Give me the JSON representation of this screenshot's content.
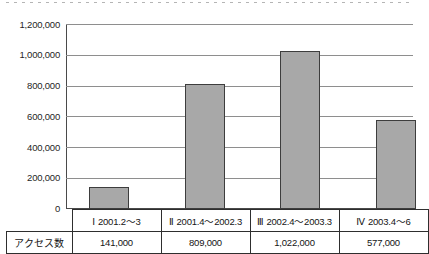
{
  "chart_data": {
    "type": "bar",
    "title": "",
    "subtitle": "",
    "xlabel": "",
    "ylabel": "",
    "categories": [
      "Ⅰ 2001.2～3",
      "Ⅱ 2001.4～2002.3",
      "Ⅲ 2002.4～2003.3",
      "Ⅳ 2003.4～6"
    ],
    "values": [
      141000,
      809000,
      1022000,
      577000
    ],
    "value_labels": [
      "141,000",
      "809,000",
      "1,022,000",
      "577,000"
    ],
    "series": [
      {
        "name": "アクセス数",
        "values": [
          141000,
          809000,
          1022000,
          577000
        ]
      }
    ],
    "ylim": [
      0,
      1200000
    ],
    "ytick_values": [
      0,
      200000,
      400000,
      600000,
      800000,
      1000000,
      1200000
    ],
    "ytick_labels": [
      "0",
      "200,000",
      "400,000",
      "600,000",
      "800,000",
      "1,000,000",
      "1,200,000"
    ],
    "grid": true,
    "legend": false,
    "legend_position": "none",
    "bar_color": "#a8a8a8",
    "bar_border_color": "#3d3d3d",
    "gridline_color": "#8e8e8e",
    "axis_color": "#4a4a4a"
  },
  "table": {
    "row_header_label": "アクセス数",
    "period_row": [
      {
        "roman": "Ⅰ",
        "range": "2001.2～3"
      },
      {
        "roman": "Ⅱ",
        "range": "2001.4～2002.3"
      },
      {
        "roman": "Ⅲ",
        "range": "2002.4～2003.3"
      },
      {
        "roman": "Ⅳ",
        "range": "2003.4～6"
      }
    ],
    "value_row": [
      "141,000",
      "809,000",
      "1,022,000",
      "577,000"
    ]
  }
}
